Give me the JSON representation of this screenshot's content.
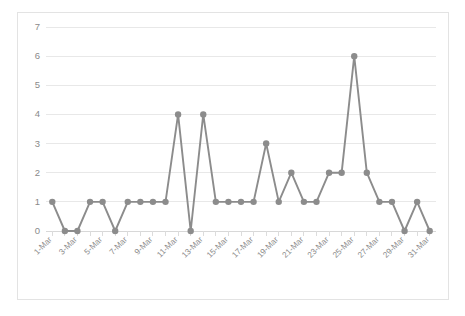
{
  "chart_data": {
    "type": "line",
    "title": "",
    "xlabel": "",
    "ylabel": "",
    "ylim": [
      0,
      7
    ],
    "ytick_labels": [
      "0",
      "1",
      "2",
      "3",
      "4",
      "5",
      "6",
      "7"
    ],
    "yticks": [
      0,
      1,
      2,
      3,
      4,
      5,
      6,
      7
    ],
    "grid": true,
    "legend": "none",
    "categories": [
      "1-Mar",
      "2-Mar",
      "3-Mar",
      "4-Mar",
      "5-Mar",
      "6-Mar",
      "7-Mar",
      "8-Mar",
      "9-Mar",
      "10-Mar",
      "11-Mar",
      "12-Mar",
      "13-Mar",
      "14-Mar",
      "15-Mar",
      "16-Mar",
      "17-Mar",
      "18-Mar",
      "19-Mar",
      "20-Mar",
      "21-Mar",
      "22-Mar",
      "23-Mar",
      "24-Mar",
      "25-Mar",
      "26-Mar",
      "27-Mar",
      "28-Mar",
      "29-Mar",
      "30-Mar",
      "31-Mar"
    ],
    "xtick_labels": [
      "1-Mar",
      "3-Mar",
      "5-Mar",
      "7-Mar",
      "9-Mar",
      "11-Mar",
      "13-Mar",
      "15-Mar",
      "17-Mar",
      "19-Mar",
      "21-Mar",
      "23-Mar",
      "25-Mar",
      "27-Mar",
      "29-Mar",
      "31-Mar"
    ],
    "values": [
      1,
      0,
      0,
      1,
      1,
      0,
      1,
      1,
      1,
      1,
      4,
      0,
      4,
      1,
      1,
      1,
      1,
      3,
      1,
      2,
      1,
      1,
      2,
      2,
      6,
      2,
      1,
      1,
      0,
      1,
      0
    ],
    "series_color": "#8c8c8c",
    "marker": "circle",
    "marker_size": 3.2
  },
  "style": {
    "background": "#ffffff",
    "border_color": "#e3e3e3",
    "gridline_color": "#e8e8e8",
    "tick_text_color": "#8a8a8a"
  }
}
